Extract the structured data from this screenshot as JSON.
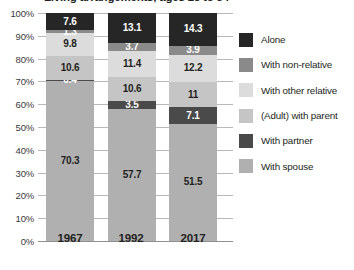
{
  "chart_data": {
    "type": "bar",
    "stacked": true,
    "title": "Living arrangements, ages 25 to 34",
    "xlabel": "",
    "ylabel": "",
    "ylim": [
      0,
      100
    ],
    "ytick_labels": [
      "0%",
      "10%",
      "20%",
      "30%",
      "40%",
      "50%",
      "60%",
      "70%",
      "80%",
      "90%",
      "100%"
    ],
    "ytick_values": [
      0,
      10,
      20,
      30,
      40,
      50,
      60,
      70,
      80,
      90,
      100
    ],
    "grid": true,
    "legend_position": "right",
    "categories": [
      "1967",
      "1992",
      "2017"
    ],
    "series": [
      {
        "name": "With spouse",
        "color": "#b0b0b0",
        "label_color": "dark",
        "values": [
          70.3,
          57.7,
          51.5
        ],
        "labels": [
          "70.3",
          "57.7",
          "51.5"
        ]
      },
      {
        "name": "With partner",
        "color": "#4a4a4a",
        "label_color": "light",
        "values": [
          0.4,
          3.5,
          7.1
        ],
        "labels": [
          "0.4",
          "3.5",
          "7.1"
        ]
      },
      {
        "name": "(Adult) with parent",
        "color": "#c5c5c5",
        "label_color": "dark",
        "values": [
          10.6,
          10.6,
          11
        ],
        "labels": [
          "10.6",
          "10.6",
          "11"
        ]
      },
      {
        "name": "With other relative",
        "color": "#dcdcdc",
        "label_color": "dark",
        "values": [
          9.8,
          11.4,
          12.2
        ],
        "labels": [
          "9.8",
          "11.4",
          "12.2"
        ]
      },
      {
        "name": "With non-relative",
        "color": "#8a8a8a",
        "label_color": "light",
        "values": [
          1.3,
          3.7,
          3.9
        ],
        "labels": [
          "1.3",
          "3.7",
          "3.9"
        ]
      },
      {
        "name": "Alone",
        "color": "#262626",
        "label_color": "light",
        "values": [
          7.6,
          13.1,
          14.3
        ],
        "labels": [
          "7.6",
          "13.1",
          "14.3"
        ]
      }
    ],
    "legend_order": [
      "Alone",
      "With non-relative",
      "With other relative",
      "(Adult) with parent",
      "With partner",
      "With spouse"
    ]
  }
}
